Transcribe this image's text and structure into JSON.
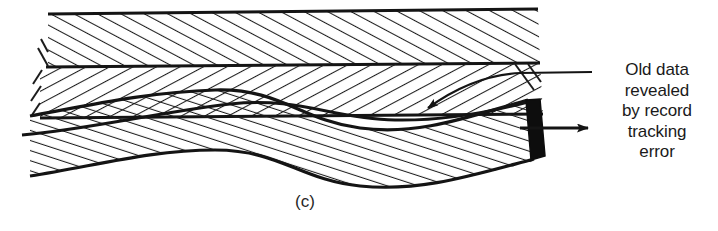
{
  "figure": {
    "caption": "(c)",
    "kind": "cross-section-diagram"
  },
  "annotation": {
    "text": "Old data\nrevealed\nby record\ntracking\nerror",
    "lines": [
      "Old data",
      "revealed",
      "by record",
      "tracking",
      "error"
    ],
    "align": "center",
    "leader": "curved-leader-line-with-arrowhead"
  },
  "arrow": {
    "name": "direction-arrow",
    "label": ""
  },
  "colors": {
    "ink": "#141414",
    "background": "#ffffff",
    "wedge_fill": "#0d0d0d",
    "hatch": "#1c1c1c"
  },
  "bands": [
    {
      "name": "upper-band",
      "hatch_direction": "forward-slash",
      "label": ""
    },
    {
      "name": "middle-band",
      "hatch_direction": "back-slash",
      "label": ""
    },
    {
      "name": "lower-wavy-band",
      "hatch_direction": "forward-slash",
      "label": ""
    }
  ]
}
